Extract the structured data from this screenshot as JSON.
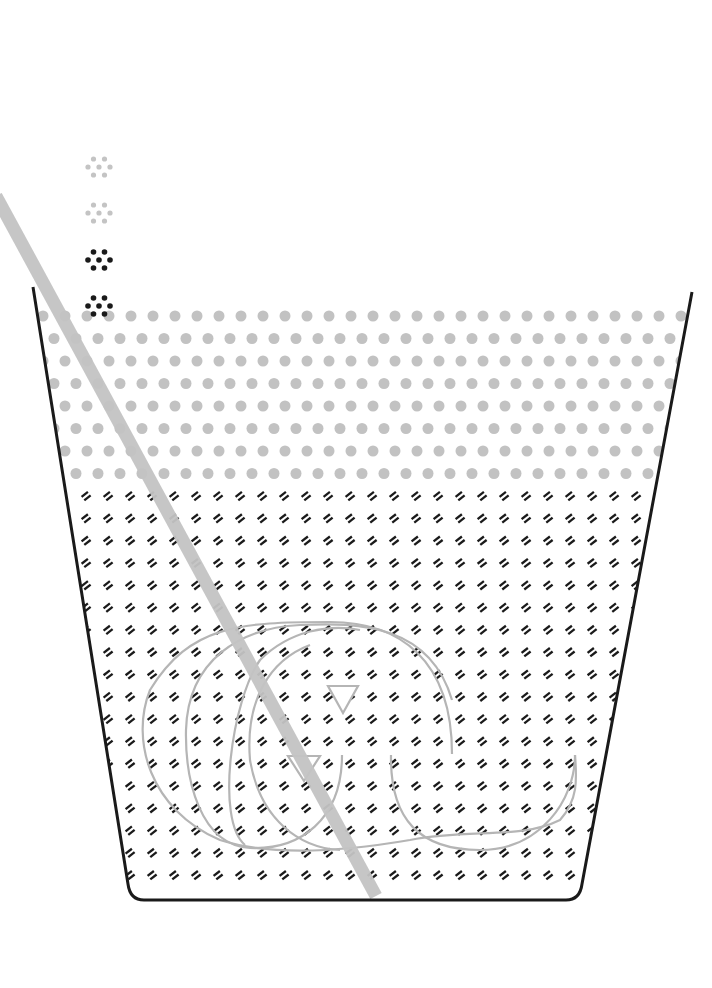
{
  "diagram": {
    "canvas": {
      "width": 712,
      "height": 988,
      "background": "#ffffff"
    },
    "colors": {
      "cup_outline": "#1a1a1a",
      "straw": "#c4c4c4",
      "upper_layer_dot": "#c2c2c2",
      "lower_layer_mark": "#1a1a1a",
      "swirl": "#b5b5b5",
      "particle_light": "#c4c4c4",
      "particle_dark": "#1a1a1a"
    },
    "cup": {
      "top_left": [
        33,
        287
      ],
      "bottom_left": [
        128,
        884
      ],
      "bottom_right": [
        582,
        884
      ],
      "top_right": [
        692,
        292
      ],
      "bottom_y": 900,
      "corner_radius": 16,
      "stroke_width": 3
    },
    "upper_layer": {
      "label": "light particle layer",
      "rows": 8,
      "row_y_start": 316,
      "row_spacing": 22.5,
      "col_spacing": 22,
      "dot_radius": 5.5
    },
    "lower_layer": {
      "label": "dark particle layer",
      "rows": 18,
      "row_y_start": 496,
      "row_spacing": 22.3,
      "col_spacing": 22,
      "x_offset": 86
    },
    "straw": {
      "x1": -4,
      "y1": 196,
      "x2": 376,
      "y2": 896,
      "width": 13
    },
    "falling_particles": [
      {
        "cx": 99,
        "cy": 167,
        "tone": "light"
      },
      {
        "cx": 99,
        "cy": 213,
        "tone": "light"
      },
      {
        "cx": 99,
        "cy": 260,
        "tone": "dark"
      },
      {
        "cx": 99,
        "cy": 306,
        "tone": "dark"
      }
    ],
    "swirl": {
      "label": "circulation arrows",
      "arrows": [
        {
          "points": "328,686 358,686 343,713"
        },
        {
          "points": "288,756 320,756 304,781"
        }
      ]
    }
  }
}
